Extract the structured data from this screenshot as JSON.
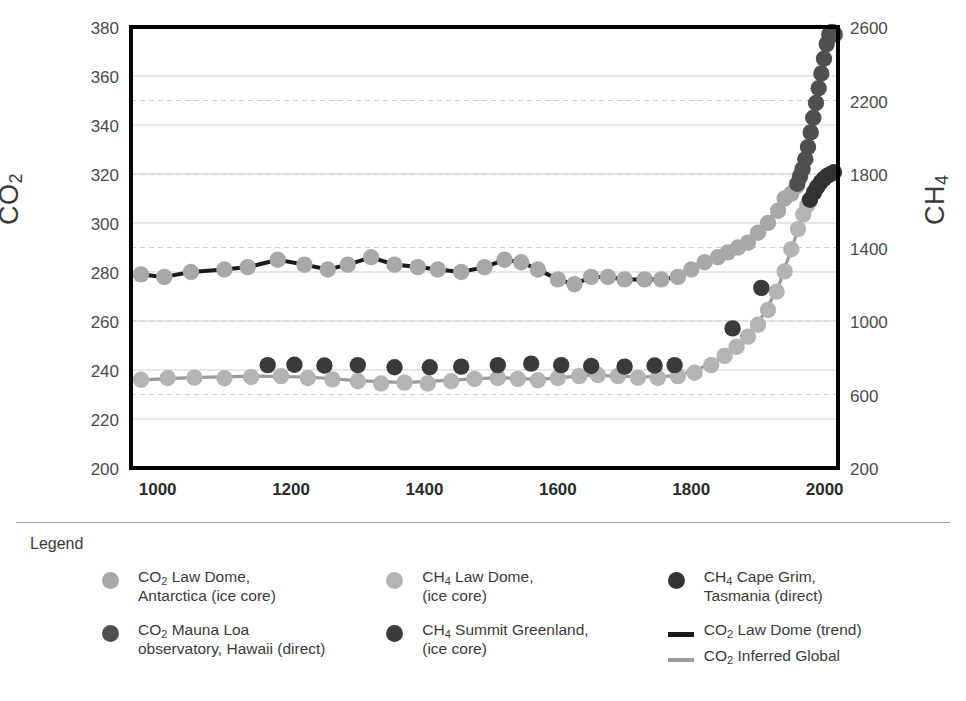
{
  "axes": {
    "left_title": "CO",
    "left_title_sub": "2",
    "right_title": "CH",
    "right_title_sub": "4"
  },
  "legend": {
    "title": "Legend",
    "columns": [
      {
        "entries": [
          {
            "marker": "dot",
            "color": "#a8a8a8",
            "species": "CO",
            "sub": "2",
            "text": " Law Dome,\nAntarctica (ice core)"
          },
          {
            "marker": "dot",
            "color": "#4f4f4f",
            "species": "CO",
            "sub": "2",
            "text": " Mauna Loa\nobservatory, Hawaii (direct)"
          }
        ]
      },
      {
        "entries": [
          {
            "marker": "dot",
            "color": "#b4b4b4",
            "species": "CH",
            "sub": "4",
            "text": " Law Dome,\n(ice core)"
          },
          {
            "marker": "dot",
            "color": "#3a3a3a",
            "species": "CH",
            "sub": "4",
            "text": " Summit Greenland,\n(ice core)"
          }
        ]
      },
      {
        "entries": [
          {
            "marker": "dot",
            "color": "#333333",
            "species": "CH",
            "sub": "4",
            "text": " Cape Grim,\nTasmania (direct)"
          },
          {
            "marker": "line-thick",
            "color": "#1a1a1a",
            "species": "CO",
            "sub": "2",
            "text": " Law Dome (trend)"
          },
          {
            "marker": "line",
            "color": "#9b9b9b",
            "species": "CO",
            "sub": "2",
            "text": " Inferred Global"
          }
        ]
      }
    ]
  },
  "chart_data": {
    "type": "scatter",
    "title": "",
    "xlabel": "",
    "ylabel": "CO2",
    "y2label": "CH4",
    "xlim": [
      960,
      2020
    ],
    "ylim": [
      200,
      380
    ],
    "y2lim": [
      200,
      2600
    ],
    "xticks": [
      1000,
      1200,
      1400,
      1600,
      1800,
      2000
    ],
    "yticks": [
      200,
      220,
      240,
      260,
      280,
      300,
      320,
      340,
      360,
      380
    ],
    "y2ticks": [
      200,
      600,
      1000,
      1400,
      1800,
      2200,
      2600
    ],
    "grid": {
      "co2_lines": "solid",
      "ch4_lines": "dashed",
      "color": "#cfcfcf"
    },
    "legend_position": "below-plot",
    "colors": {
      "co2_ice": "#a8a8a8",
      "co2_direct": "#4f4f4f",
      "ch4_ice": "#b4b4b4",
      "ch4_greenland": "#3a3a3a",
      "ch4_capegrim": "#333333",
      "co2_trend_line": "#1a1a1a",
      "ch4_inferred_line": "#9b9b9b",
      "frame": "#000000"
    },
    "series": [
      {
        "name": "CO2 Law Dome, Antarctica (ice core)",
        "axis": "left",
        "marker": "circle",
        "color": "#a8a8a8",
        "points": [
          [
            975,
            279
          ],
          [
            1010,
            278
          ],
          [
            1050,
            280
          ],
          [
            1100,
            281
          ],
          [
            1135,
            282
          ],
          [
            1180,
            285
          ],
          [
            1220,
            283
          ],
          [
            1255,
            281
          ],
          [
            1285,
            283
          ],
          [
            1320,
            286
          ],
          [
            1355,
            283
          ],
          [
            1390,
            282
          ],
          [
            1420,
            281
          ],
          [
            1455,
            280
          ],
          [
            1490,
            282
          ],
          [
            1520,
            285
          ],
          [
            1545,
            284
          ],
          [
            1570,
            281
          ],
          [
            1600,
            277
          ],
          [
            1625,
            275
          ],
          [
            1650,
            278
          ],
          [
            1675,
            278
          ],
          [
            1700,
            277
          ],
          [
            1730,
            277
          ],
          [
            1755,
            277
          ],
          [
            1780,
            278
          ],
          [
            1800,
            281
          ],
          [
            1820,
            284
          ],
          [
            1840,
            286
          ],
          [
            1855,
            288
          ],
          [
            1870,
            290
          ],
          [
            1885,
            292
          ],
          [
            1900,
            296
          ],
          [
            1915,
            300
          ],
          [
            1930,
            305
          ],
          [
            1940,
            310
          ],
          [
            1950,
            312
          ],
          [
            1958,
            315
          ]
        ]
      },
      {
        "name": "CO2 Mauna Loa observatory, Hawaii (direct)",
        "axis": "left",
        "marker": "circle",
        "color": "#4f4f4f",
        "points": [
          [
            1959,
            316
          ],
          [
            1963,
            319
          ],
          [
            1967,
            322
          ],
          [
            1971,
            326
          ],
          [
            1975,
            331
          ],
          [
            1979,
            337
          ],
          [
            1983,
            343
          ],
          [
            1987,
            349
          ],
          [
            1991,
            355
          ],
          [
            1995,
            361
          ],
          [
            1999,
            367
          ],
          [
            2003,
            373
          ],
          [
            2007,
            377
          ],
          [
            2011,
            378
          ],
          [
            2015,
            377
          ]
        ]
      },
      {
        "name": "CH4 Law Dome, (ice core)",
        "axis": "right",
        "marker": "circle",
        "color": "#b4b4b4",
        "points": [
          [
            975,
            680
          ],
          [
            1015,
            690
          ],
          [
            1055,
            692
          ],
          [
            1100,
            688
          ],
          [
            1140,
            695
          ],
          [
            1185,
            700
          ],
          [
            1225,
            690
          ],
          [
            1262,
            682
          ],
          [
            1300,
            672
          ],
          [
            1335,
            660
          ],
          [
            1370,
            665
          ],
          [
            1405,
            660
          ],
          [
            1440,
            672
          ],
          [
            1475,
            685
          ],
          [
            1510,
            690
          ],
          [
            1540,
            685
          ],
          [
            1570,
            678
          ],
          [
            1600,
            690
          ],
          [
            1632,
            700
          ],
          [
            1660,
            706
          ],
          [
            1690,
            700
          ],
          [
            1720,
            692
          ],
          [
            1750,
            690
          ],
          [
            1780,
            700
          ],
          [
            1805,
            718
          ],
          [
            1830,
            760
          ],
          [
            1850,
            810
          ],
          [
            1868,
            860
          ],
          [
            1885,
            915
          ],
          [
            1900,
            980
          ],
          [
            1915,
            1060
          ],
          [
            1928,
            1160
          ],
          [
            1940,
            1270
          ],
          [
            1950,
            1390
          ],
          [
            1960,
            1500
          ],
          [
            1968,
            1580
          ],
          [
            1974,
            1630
          ]
        ]
      },
      {
        "name": "CH4 Summit Greenland, (ice core)",
        "axis": "right",
        "marker": "circle",
        "color": "#3a3a3a",
        "points": [
          [
            1165,
            760
          ],
          [
            1205,
            762
          ],
          [
            1250,
            758
          ],
          [
            1300,
            760
          ],
          [
            1355,
            748
          ],
          [
            1408,
            748
          ],
          [
            1455,
            752
          ],
          [
            1510,
            760
          ],
          [
            1560,
            768
          ],
          [
            1605,
            760
          ],
          [
            1650,
            755
          ],
          [
            1700,
            752
          ],
          [
            1745,
            758
          ],
          [
            1775,
            760
          ],
          [
            1862,
            960
          ],
          [
            1905,
            1180
          ]
        ]
      },
      {
        "name": "CH4 Cape Grim, Tasmania (direct)",
        "axis": "right",
        "marker": "circle",
        "color": "#333333",
        "points": [
          [
            1978,
            1660
          ],
          [
            1984,
            1700
          ],
          [
            1989,
            1730
          ],
          [
            1994,
            1755
          ],
          [
            1999,
            1775
          ],
          [
            2004,
            1790
          ],
          [
            2009,
            1800
          ],
          [
            2014,
            1810
          ]
        ]
      },
      {
        "name": "CO2 Law Dome (trend)",
        "axis": "left",
        "marker": "line",
        "color": "#1a1a1a",
        "points": [
          [
            975,
            279
          ],
          [
            1010,
            278
          ],
          [
            1050,
            280
          ],
          [
            1100,
            281
          ],
          [
            1135,
            282
          ],
          [
            1180,
            285
          ],
          [
            1220,
            283
          ],
          [
            1255,
            281
          ],
          [
            1285,
            283
          ],
          [
            1320,
            286
          ],
          [
            1355,
            283
          ],
          [
            1390,
            282
          ],
          [
            1420,
            281
          ],
          [
            1455,
            280
          ],
          [
            1490,
            282
          ],
          [
            1520,
            285
          ],
          [
            1545,
            284
          ],
          [
            1570,
            281
          ],
          [
            1600,
            277
          ],
          [
            1625,
            275
          ],
          [
            1650,
            278
          ],
          [
            1675,
            278
          ],
          [
            1700,
            277
          ],
          [
            1730,
            277
          ],
          [
            1755,
            277
          ],
          [
            1780,
            278
          ],
          [
            1800,
            281
          ],
          [
            1820,
            284
          ],
          [
            1840,
            286
          ],
          [
            1860,
            289
          ],
          [
            1880,
            292
          ],
          [
            1900,
            296
          ],
          [
            1920,
            302
          ],
          [
            1940,
            310
          ],
          [
            1960,
            317
          ],
          [
            1980,
            338
          ],
          [
            2000,
            369
          ],
          [
            2015,
            377
          ]
        ]
      },
      {
        "name": "CO2 Inferred Global",
        "axis": "right",
        "marker": "line",
        "color": "#9b9b9b",
        "points": [
          [
            975,
            680
          ],
          [
            1050,
            692
          ],
          [
            1140,
            700
          ],
          [
            1225,
            695
          ],
          [
            1300,
            675
          ],
          [
            1370,
            665
          ],
          [
            1440,
            678
          ],
          [
            1510,
            692
          ],
          [
            1570,
            682
          ],
          [
            1650,
            705
          ],
          [
            1720,
            695
          ],
          [
            1780,
            702
          ],
          [
            1830,
            765
          ],
          [
            1870,
            870
          ],
          [
            1900,
            985
          ],
          [
            1930,
            1180
          ],
          [
            1950,
            1390
          ],
          [
            1970,
            1600
          ],
          [
            1990,
            1740
          ],
          [
            2015,
            1810
          ]
        ]
      }
    ]
  }
}
